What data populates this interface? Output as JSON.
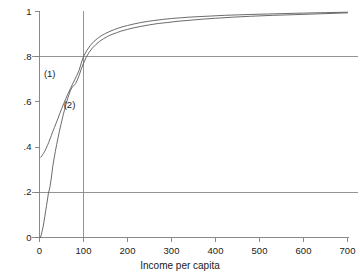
{
  "chart_data": {
    "type": "line",
    "title": "",
    "subtitle": "",
    "xlabel": "Income per capita",
    "ylabel": "",
    "xlim": [
      0,
      700
    ],
    "ylim": [
      0,
      1
    ],
    "xticks": [
      0,
      100,
      200,
      300,
      400,
      500,
      600,
      700
    ],
    "xticklabels": [
      "0",
      "100",
      "200",
      "300",
      "400",
      "500",
      "600",
      "700"
    ],
    "yticks": [
      0,
      0.2,
      0.4,
      0.6,
      0.8,
      1
    ],
    "yticklabels": [
      "0",
      ".2",
      ".4",
      ".6",
      ".8",
      "1"
    ],
    "grid": false,
    "legend": "inline-annotations",
    "annotations": [
      {
        "text": "(1)",
        "x": 10,
        "y": 0.725,
        "name": "curve-1-label"
      },
      {
        "text": "(2)",
        "x": 55,
        "y": 0.585,
        "name": "curve-2-label"
      }
    ],
    "reference_lines": [
      {
        "orientation": "vertical",
        "value": 100,
        "color": "#888888"
      },
      {
        "orientation": "horizontal",
        "value": 0.8,
        "color": "#888888"
      },
      {
        "orientation": "horizontal",
        "value": 0.2,
        "color": "#888888"
      }
    ],
    "line_color": "#5a5a5a",
    "series": [
      {
        "name": "(1)",
        "x": [
          3,
          6,
          9,
          12,
          15,
          18,
          21,
          24,
          27,
          30,
          34,
          38,
          42,
          46,
          50,
          55,
          60,
          65,
          70,
          75,
          80,
          85,
          90,
          95,
          100,
          108,
          116,
          124,
          132,
          140,
          150,
          160,
          170,
          180,
          190,
          200,
          215,
          230,
          245,
          260,
          280,
          300,
          320,
          340,
          360,
          390,
          420,
          450,
          480,
          520,
          560,
          600,
          650,
          700
        ],
        "y": [
          0.355,
          0.363,
          0.372,
          0.382,
          0.394,
          0.407,
          0.421,
          0.436,
          0.452,
          0.468,
          0.487,
          0.507,
          0.527,
          0.548,
          0.568,
          0.592,
          0.615,
          0.637,
          0.658,
          0.678,
          0.698,
          0.718,
          0.74,
          0.772,
          0.801,
          0.829,
          0.851,
          0.868,
          0.881,
          0.892,
          0.903,
          0.912,
          0.92,
          0.927,
          0.933,
          0.938,
          0.945,
          0.951,
          0.956,
          0.96,
          0.965,
          0.969,
          0.972,
          0.975,
          0.977,
          0.98,
          0.983,
          0.985,
          0.987,
          0.989,
          0.991,
          0.993,
          0.995,
          0.997
        ]
      },
      {
        "name": "(2)",
        "x": [
          2,
          4,
          6,
          8,
          10,
          12,
          14,
          16,
          18,
          20,
          22,
          24,
          26,
          28,
          30,
          33,
          36,
          39,
          42,
          45,
          48,
          51,
          54,
          57,
          60,
          63,
          66,
          70,
          74,
          78,
          82,
          86,
          90,
          95,
          100,
          106,
          112,
          120,
          128,
          136,
          145,
          155,
          165,
          175,
          185,
          200,
          215,
          230,
          250,
          270,
          290,
          315,
          340,
          370,
          400,
          440,
          480,
          530,
          580,
          640,
          700
        ],
        "y": [
          0.0,
          0.012,
          0.028,
          0.046,
          0.068,
          0.092,
          0.118,
          0.142,
          0.166,
          0.193,
          0.209,
          0.226,
          0.252,
          0.281,
          0.313,
          0.348,
          0.381,
          0.411,
          0.44,
          0.468,
          0.494,
          0.519,
          0.543,
          0.566,
          0.588,
          0.608,
          0.627,
          0.649,
          0.665,
          0.672,
          0.681,
          0.697,
          0.717,
          0.746,
          0.771,
          0.797,
          0.817,
          0.838,
          0.854,
          0.867,
          0.879,
          0.89,
          0.899,
          0.906,
          0.913,
          0.921,
          0.928,
          0.934,
          0.941,
          0.947,
          0.951,
          0.957,
          0.961,
          0.966,
          0.97,
          0.975,
          0.979,
          0.983,
          0.986,
          0.99,
          0.994
        ]
      }
    ]
  }
}
